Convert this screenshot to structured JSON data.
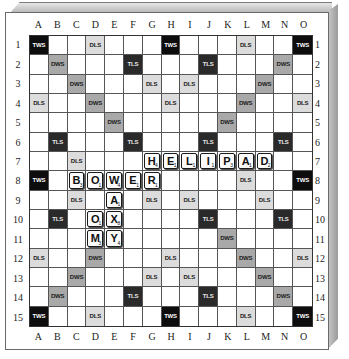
{
  "board": {
    "columns": [
      "A",
      "B",
      "C",
      "D",
      "E",
      "F",
      "G",
      "H",
      "I",
      "J",
      "K",
      "L",
      "M",
      "N",
      "O"
    ],
    "rows": [
      "1",
      "2",
      "3",
      "4",
      "5",
      "6",
      "7",
      "8",
      "9",
      "10",
      "11",
      "12",
      "13",
      "14",
      "15"
    ],
    "premium_squares": [
      [
        "TWS",
        "",
        "",
        "DLS",
        "",
        "",
        "",
        "TWS",
        "",
        "",
        "",
        "DLS",
        "",
        "",
        "TWS"
      ],
      [
        "",
        "DWS",
        "",
        "",
        "",
        "TLS",
        "",
        "",
        "",
        "TLS",
        "",
        "",
        "",
        "DWS",
        ""
      ],
      [
        "",
        "",
        "DWS",
        "",
        "",
        "",
        "DLS",
        "",
        "DLS",
        "",
        "",
        "",
        "DWS",
        "",
        ""
      ],
      [
        "DLS",
        "",
        "",
        "DWS",
        "",
        "",
        "",
        "DLS",
        "",
        "",
        "",
        "DWS",
        "",
        "",
        "DLS"
      ],
      [
        "",
        "",
        "",
        "",
        "DWS",
        "",
        "",
        "",
        "",
        "",
        "DWS",
        "",
        "",
        "",
        ""
      ],
      [
        "",
        "TLS",
        "",
        "",
        "",
        "TLS",
        "",
        "",
        "",
        "TLS",
        "",
        "",
        "",
        "TLS",
        ""
      ],
      [
        "",
        "",
        "DLS",
        "",
        "",
        "",
        "",
        "",
        "",
        "",
        "",
        "",
        "",
        "",
        ""
      ],
      [
        "TWS",
        "",
        "",
        "",
        "",
        "",
        "",
        "",
        "",
        "",
        "",
        "DLS",
        "",
        "",
        "TWS"
      ],
      [
        "",
        "",
        "DLS",
        "",
        "",
        "",
        "DLS",
        "",
        "DLS",
        "",
        "",
        "",
        "DLS",
        "",
        ""
      ],
      [
        "",
        "TLS",
        "",
        "",
        "",
        "",
        "",
        "",
        "",
        "TLS",
        "",
        "",
        "",
        "TLS",
        ""
      ],
      [
        "",
        "",
        "",
        "",
        "",
        "",
        "",
        "",
        "",
        "",
        "DWS",
        "",
        "",
        "",
        ""
      ],
      [
        "DLS",
        "",
        "",
        "DWS",
        "",
        "",
        "",
        "DLS",
        "",
        "",
        "",
        "DWS",
        "",
        "",
        "DLS"
      ],
      [
        "",
        "",
        "DWS",
        "",
        "",
        "",
        "DLS",
        "",
        "DLS",
        "",
        "",
        "",
        "DWS",
        "",
        ""
      ],
      [
        "",
        "DWS",
        "",
        "",
        "",
        "TLS",
        "",
        "",
        "",
        "TLS",
        "",
        "",
        "",
        "DWS",
        ""
      ],
      [
        "TWS",
        "",
        "",
        "DLS",
        "",
        "",
        "",
        "TWS",
        "",
        "",
        "",
        "DLS",
        "",
        "",
        "TWS"
      ]
    ],
    "tiles": [
      {
        "row": 7,
        "col": "G",
        "letter": "H",
        "points": "4"
      },
      {
        "row": 7,
        "col": "H",
        "letter": "E",
        "points": "1"
      },
      {
        "row": 7,
        "col": "I",
        "letter": "L",
        "points": "1"
      },
      {
        "row": 7,
        "col": "J",
        "letter": "I",
        "points": "1"
      },
      {
        "row": 7,
        "col": "K",
        "letter": "P",
        "points": "3"
      },
      {
        "row": 7,
        "col": "L",
        "letter": "A",
        "points": "1"
      },
      {
        "row": 7,
        "col": "M",
        "letter": "D",
        "points": "2"
      },
      {
        "row": 8,
        "col": "C",
        "letter": "B",
        "points": "3"
      },
      {
        "row": 8,
        "col": "D",
        "letter": "O",
        "points": "1"
      },
      {
        "row": 8,
        "col": "E",
        "letter": "W",
        "points": "4"
      },
      {
        "row": 8,
        "col": "F",
        "letter": "E",
        "points": "1"
      },
      {
        "row": 8,
        "col": "G",
        "letter": "R",
        "points": "1"
      },
      {
        "row": 9,
        "col": "E",
        "letter": "A",
        "points": "1"
      },
      {
        "row": 10,
        "col": "D",
        "letter": "O",
        "points": "1"
      },
      {
        "row": 10,
        "col": "E",
        "letter": "X",
        "points": "8"
      },
      {
        "row": 11,
        "col": "D",
        "letter": "M",
        "points": "3"
      },
      {
        "row": 11,
        "col": "E",
        "letter": "Y",
        "points": "4"
      }
    ],
    "words": [
      "HELIPAD",
      "BOWER",
      "WAX",
      "OX",
      "MY",
      "OM",
      "XY"
    ]
  }
}
